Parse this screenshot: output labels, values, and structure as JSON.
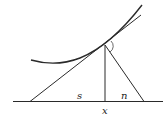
{
  "diagram": {
    "labels": {
      "subtangent": "s",
      "subnormal": "n",
      "abscissa": "x"
    },
    "colors": {
      "stroke": "#2a2a2a",
      "background": "#ffffff"
    },
    "elements": [
      "curve",
      "tangent-line",
      "normal-line",
      "ordinate",
      "x-axis",
      "right-angle-arc"
    ]
  }
}
